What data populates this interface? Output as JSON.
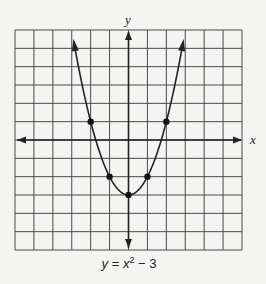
{
  "chart_data": {
    "type": "line",
    "equation": "y = x^2 - 3",
    "caption": {
      "lhs": "y",
      "eq": " = ",
      "var": "x",
      "exp": "2",
      "rest": " − 3"
    },
    "xlabel": "x",
    "ylabel": "y",
    "xlim": [
      -6,
      6
    ],
    "ylim": [
      -6,
      6
    ],
    "grid": true,
    "grid_step": 1,
    "tick_labels": false,
    "axis_arrows": true,
    "curve_arrows": true,
    "series": [
      {
        "name": "y = x^2 - 3",
        "function": "x^2 - 3",
        "marked_points": [
          {
            "x": -2,
            "y": 1
          },
          {
            "x": -1,
            "y": -2
          },
          {
            "x": 0,
            "y": -3
          },
          {
            "x": 1,
            "y": -2
          },
          {
            "x": 2,
            "y": 1
          }
        ]
      }
    ],
    "legend": null
  },
  "colors": {
    "background": "#f4f4f2",
    "grid": "#4a4a4a",
    "ink": "#222222"
  }
}
